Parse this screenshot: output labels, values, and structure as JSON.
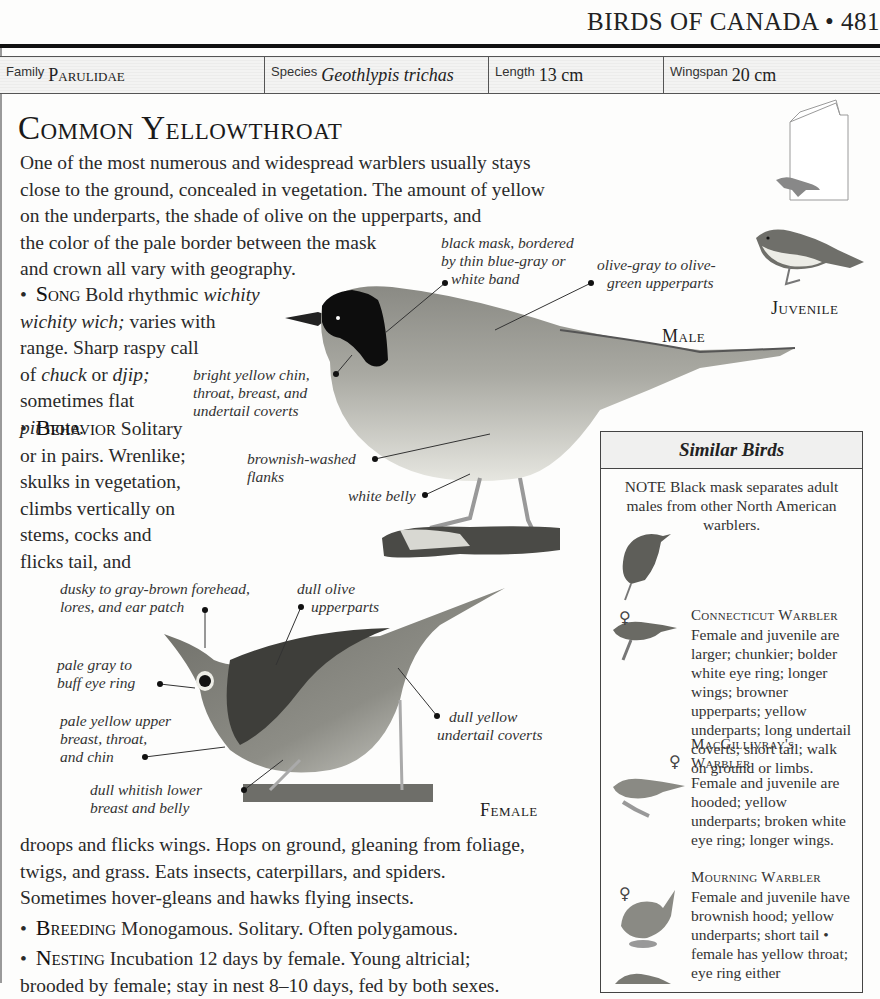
{
  "page": {
    "running_head": "BIRDS OF CANADA • 481"
  },
  "info_bar": {
    "family_label": "Family",
    "family_value": "Parulidae",
    "species_label": "Species",
    "species_value": "Geothlypis trichas",
    "length_label": "Length",
    "length_value": "13 cm",
    "wingspan_label": "Wingspan",
    "wingspan_value": "20 cm"
  },
  "species": {
    "title": "Common Yellowthroat",
    "intro_lines": [
      "One of the most numerous and widespread warblers usually stays",
      "close to the ground, concealed in vegetation. The amount of yellow",
      "on the underparts, the shade of olive on the upperparts, and",
      "the color of the pale border between the mask",
      "and crown all vary with geography."
    ]
  },
  "sections": {
    "song": {
      "head": "Song",
      "lines": [
        {
          "pre": "Bold rhythmic ",
          "it": "wichity"
        },
        {
          "it": "wichity wich;",
          "post": " varies with"
        },
        {
          "pre": "range. Sharp raspy call"
        },
        {
          "pre": "of ",
          "it": "chuck",
          "post": " or ",
          "it2": "djip;"
        },
        {
          "pre": "sometimes flat"
        },
        {
          "it": "pit",
          "post": " note."
        }
      ]
    },
    "behavior": {
      "head": "Behavior",
      "first": "Solitary",
      "lines": [
        "or in pairs. Wrenlike;",
        "skulks in vegetation,",
        "climbs vertically on",
        "stems, cocks and",
        "flicks tail, and"
      ],
      "continued": [
        "droops and flicks wings. Hops on ground, gleaning from foliage,",
        "twigs, and grass. Eats insects, caterpillars, and spiders.",
        "Sometimes hover-gleans and hawks flying insects."
      ]
    },
    "breeding": {
      "head": "Breeding",
      "text": "Monogamous. Solitary. Often polygamous."
    },
    "nesting": {
      "head": "Nesting",
      "text": "Incubation 12 days by female. Young altricial;",
      "text2": "brooded by female; stay in nest 8–10 days, fed by both sexes."
    }
  },
  "figures": {
    "male_label": "Male",
    "female_label": "Female",
    "juvenile_label": "Juvenile",
    "male_annotations": {
      "mask": [
        "black mask, bordered",
        "by thin blue-gray or",
        "white band"
      ],
      "upperparts": [
        "olive-gray to olive-",
        "green upperparts"
      ],
      "chin": [
        "bright yellow chin,",
        "throat, breast, and",
        "undertail coverts"
      ],
      "flanks": [
        "brownish-washed",
        "flanks"
      ],
      "belly": [
        "white belly"
      ]
    },
    "female_annotations": {
      "forehead": [
        "dusky to gray-brown forehead,",
        "lores, and ear patch"
      ],
      "upperparts": [
        "dull olive",
        "upperparts"
      ],
      "eye_ring": [
        "pale gray to",
        "buff eye ring"
      ],
      "breast": [
        "pale yellow upper",
        "breast, throat,",
        "and chin"
      ],
      "belly": [
        "dull whitish lower",
        "breast and belly"
      ],
      "undertail": [
        "dull yellow",
        "undertail coverts"
      ]
    }
  },
  "similar_birds": {
    "title": "Similar Birds",
    "note": "NOTE Black mask separates adult males from other North American warblers.",
    "items": [
      {
        "name": "Connecticut Warbler",
        "text": "Female and juvenile are larger; chunkier; bolder white eye ring; longer wings; browner upperparts; yellow underparts; long undertail coverts; short tail; walk on ground or limbs."
      },
      {
        "name": "MacGillivray's Warbler",
        "text": "Female and juvenile are hooded; yellow underparts; broken white eye ring; longer wings."
      },
      {
        "name": "Mourning Warbler",
        "text": "Female and juvenile have brownish hood; yellow underparts; short tail • female has yellow throat; eye ring either"
      }
    ],
    "female_symbol": "♀"
  }
}
